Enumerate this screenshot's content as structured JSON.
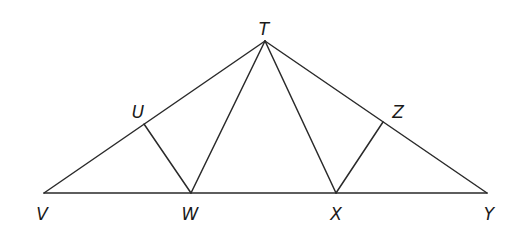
{
  "diagram": {
    "type": "geometry",
    "points": {
      "T": {
        "label": "T",
        "x": 265,
        "y": 41,
        "lx": 264,
        "ly": 35
      },
      "U": {
        "label": "U",
        "x": 144,
        "y": 124,
        "lx": 138,
        "ly": 118
      },
      "Z": {
        "label": "Z",
        "x": 383,
        "y": 122,
        "lx": 398,
        "ly": 118
      },
      "V": {
        "label": "V",
        "x": 44,
        "y": 193,
        "lx": 42,
        "ly": 220
      },
      "W": {
        "label": "W",
        "x": 191,
        "y": 193,
        "lx": 190,
        "ly": 220
      },
      "X": {
        "label": "X",
        "x": 336,
        "y": 193,
        "lx": 336,
        "ly": 220
      },
      "Y": {
        "label": "Y",
        "x": 487,
        "y": 193,
        "lx": 489,
        "ly": 220
      }
    },
    "segments": [
      [
        "V",
        "Y"
      ],
      [
        "V",
        "T"
      ],
      [
        "T",
        "Y"
      ],
      [
        "T",
        "W"
      ],
      [
        "T",
        "X"
      ],
      [
        "U",
        "W"
      ],
      [
        "Z",
        "X"
      ]
    ],
    "stroke_color": "#2a2a2a",
    "label_color": "#1a1a1a"
  }
}
